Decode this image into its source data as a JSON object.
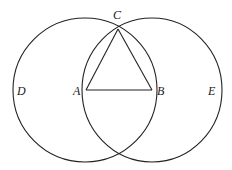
{
  "figure": {
    "type": "geometric-construction",
    "points": {
      "A": {
        "label": "A",
        "x": 86,
        "y": 90
      },
      "B": {
        "label": "B",
        "x": 152,
        "y": 90
      },
      "C": {
        "label": "C",
        "x": 118,
        "y": 29
      }
    },
    "circles": [
      {
        "name": "circle-A",
        "cx": 85,
        "cy": 90,
        "rx": 72,
        "ry": 72,
        "outer_label": "D"
      },
      {
        "name": "circle-B",
        "cx": 152,
        "cy": 90,
        "rx": 70,
        "ry": 72,
        "outer_label": "E"
      }
    ],
    "segments": [
      [
        "A",
        "B"
      ],
      [
        "A",
        "C"
      ],
      [
        "B",
        "C"
      ]
    ],
    "labels": {
      "A": "A",
      "B": "B",
      "C": "C",
      "D": "D",
      "E": "E"
    },
    "colors": {
      "stroke": "#222222",
      "background": "#ffffff"
    }
  }
}
